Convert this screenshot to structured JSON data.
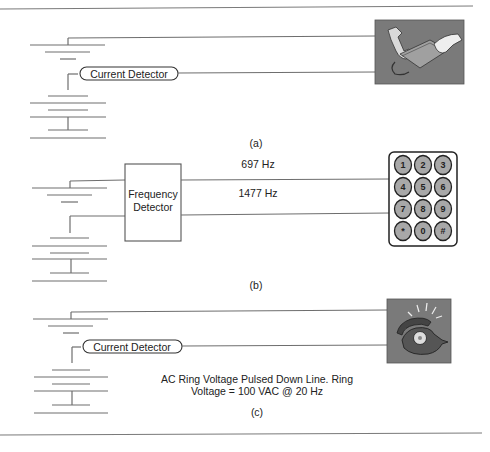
{
  "figure": {
    "panels": [
      {
        "id": "a",
        "caption": "(a)",
        "detector_label": "Current Detector",
        "device": "telephone-handset-off-hook"
      },
      {
        "id": "b",
        "caption": "(b)",
        "detector_label_line1": "Frequency",
        "detector_label_line2": "Detector",
        "tone_low": "697 Hz",
        "tone_high": "1477 Hz",
        "device": "dtmf-keypad",
        "keys": [
          "1",
          "2",
          "3",
          "4",
          "5",
          "6",
          "7",
          "8",
          "9",
          "*",
          "0",
          "#"
        ]
      },
      {
        "id": "c",
        "caption": "(c)",
        "detector_label": "Current Detector",
        "note_line1": "AC Ring Voltage Pulsed Down Line. Ring",
        "note_line2": "Voltage = 100 VAC @ 20 Hz",
        "device": "ringing-telephone"
      }
    ]
  },
  "colors": {
    "wire": "#6e6e6e",
    "device_bg": "#7a7a7a",
    "key_fill": "#a8a8a8"
  }
}
